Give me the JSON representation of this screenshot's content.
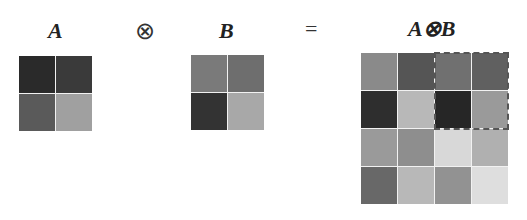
{
  "labels": {
    "a": "A",
    "kron_op": "⊗",
    "b": "B",
    "equals": "=",
    "result": "A⊗B"
  },
  "matrix_a": {
    "size": [
      2,
      2
    ],
    "cells": [
      "#2a2a2a",
      "#3a3a3a",
      "#5a5a5a",
      "#a0a0a0"
    ]
  },
  "matrix_b": {
    "size": [
      2,
      2
    ],
    "cells": [
      "#7a7a7a",
      "#6e6e6e",
      "#333333",
      "#a8a8a8"
    ]
  },
  "matrix_result": {
    "size": [
      4,
      4
    ],
    "cells": [
      "#8a8a8a",
      "#555555",
      "#707070",
      "#606060",
      "#2e2e2e",
      "#b8b8b8",
      "#262626",
      "#9a9a9a",
      "#9a9a9a",
      "#8e8e8e",
      "#d8d8d8",
      "#b0b0b0",
      "#686868",
      "#b8b8b8",
      "#929292",
      "#dedede"
    ],
    "highlight_block": "top-right 2x2 (dashed outline)"
  }
}
